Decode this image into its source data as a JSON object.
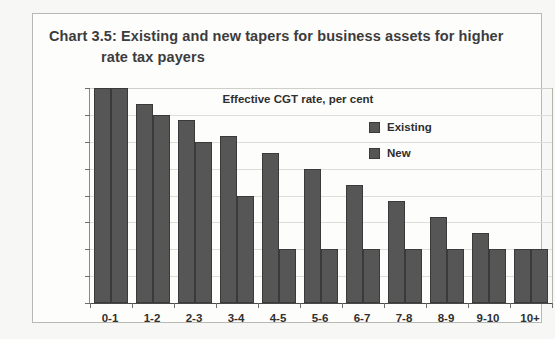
{
  "figure": {
    "title_line1": "Chart 3.5: Existing and new tapers for business assets for higher",
    "title_line2": "rate tax payers"
  },
  "chart_data": {
    "type": "bar",
    "title": "Chart 3.5: Existing and new tapers for business assets for higher rate tax payers",
    "subtitle": "Effective CGT rate, per cent",
    "xlabel": "",
    "ylabel": "",
    "ylim": [
      0,
      40
    ],
    "yticks": [
      0,
      5,
      10,
      15,
      20,
      25,
      30,
      35,
      40
    ],
    "ytick_labels": [
      "0",
      "5",
      "10",
      "15",
      "20",
      "25",
      "30",
      "35",
      "40"
    ],
    "grid": true,
    "legend_position": "inside-top-right",
    "categories": [
      "0-1",
      "1-2",
      "2-3",
      "3-4",
      "4-5",
      "5-6",
      "6-7",
      "7-8",
      "8-9",
      "9-10",
      "10+"
    ],
    "series": [
      {
        "name": "Existing",
        "color": "#565656",
        "values": [
          40,
          37,
          34,
          31,
          28,
          25,
          22,
          19,
          16,
          13,
          10
        ]
      },
      {
        "name": "New",
        "color": "#565656",
        "values": [
          40,
          35,
          30,
          20,
          10,
          10,
          10,
          10,
          10,
          10,
          10
        ]
      }
    ]
  }
}
